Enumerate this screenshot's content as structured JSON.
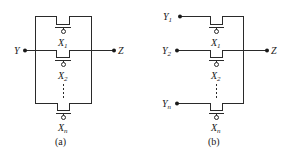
{
  "diagram_a": {
    "caption": "(a)",
    "input": {
      "label": "Y"
    },
    "output": {
      "label": "Z"
    },
    "transistors": [
      {
        "label": "X",
        "sub": "1"
      },
      {
        "label": "X",
        "sub": "2"
      },
      {
        "label": "X",
        "sub": "n"
      }
    ]
  },
  "diagram_b": {
    "caption": "(b)",
    "inputs": [
      {
        "label": "Y",
        "sub": "1"
      },
      {
        "label": "Y",
        "sub": "2"
      },
      {
        "label": "Y",
        "sub": "n"
      }
    ],
    "output": {
      "label": "Z"
    },
    "transistors": [
      {
        "label": "X",
        "sub": "1"
      },
      {
        "label": "X",
        "sub": "2"
      },
      {
        "label": "X",
        "sub": "n"
      }
    ]
  },
  "colors": {
    "line": "#2a2a2a",
    "background": "#ffffff"
  }
}
